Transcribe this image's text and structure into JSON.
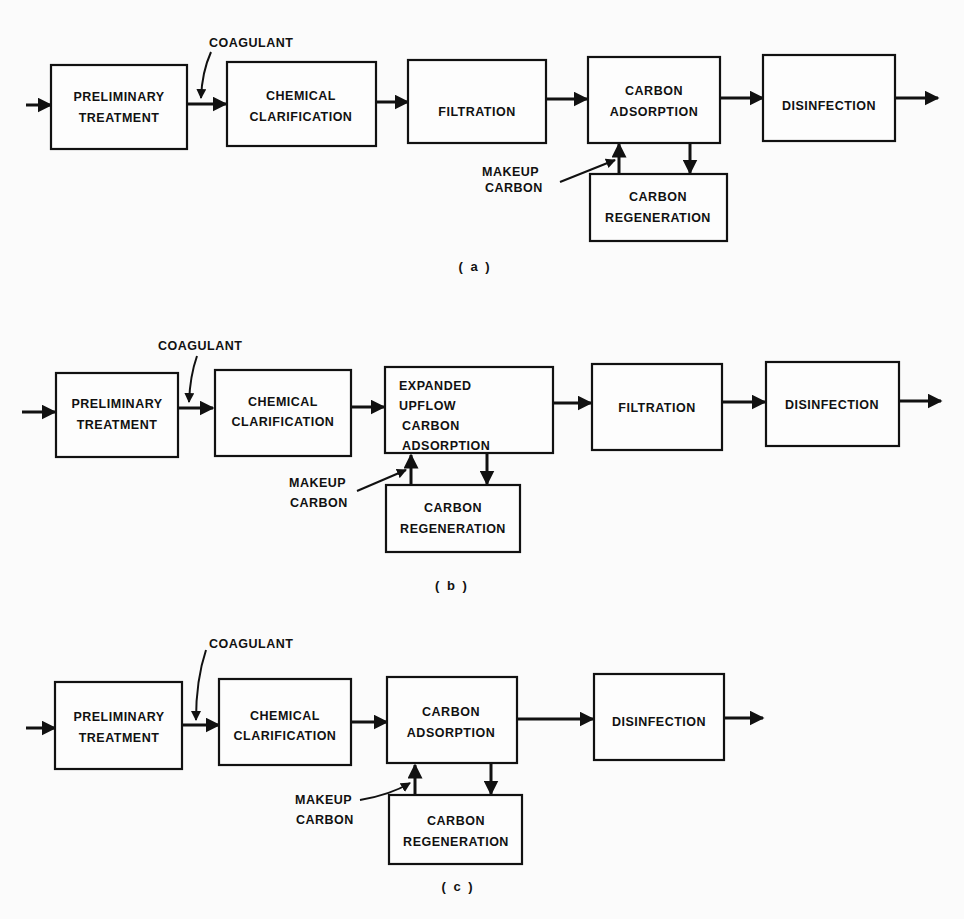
{
  "colors": {
    "ink": "#111111",
    "background": "#fbfbfb"
  },
  "diagrams": [
    {
      "caption": "( a )",
      "coagulant_label": "COAGULANT",
      "makeup_label": [
        "MAKEUP",
        "CARBON"
      ],
      "boxes": [
        {
          "lines": [
            "PRELIMINARY",
            "TREATMENT"
          ]
        },
        {
          "lines": [
            "CHEMICAL",
            "CLARIFICATION"
          ]
        },
        {
          "lines": [
            "FILTRATION"
          ]
        },
        {
          "lines": [
            "CARBON",
            "ADSORPTION"
          ]
        },
        {
          "lines": [
            "DISINFECTION"
          ]
        },
        {
          "lines": [
            "CARBON",
            "REGENERATION"
          ]
        }
      ]
    },
    {
      "caption": "( b )",
      "coagulant_label": "COAGULANT",
      "makeup_label": [
        "MAKEUP",
        "CARBON"
      ],
      "boxes": [
        {
          "lines": [
            "PRELIMINARY",
            "TREATMENT"
          ]
        },
        {
          "lines": [
            "CHEMICAL",
            "CLARIFICATION"
          ]
        },
        {
          "lines": [
            "EXPANDED",
            "UPFLOW",
            "CARBON",
            "ADSORPTION"
          ]
        },
        {
          "lines": [
            "FILTRATION"
          ]
        },
        {
          "lines": [
            "DISINFECTION"
          ]
        },
        {
          "lines": [
            "CARBON",
            "REGENERATION"
          ]
        }
      ]
    },
    {
      "caption": "( c )",
      "coagulant_label": "COAGULANT",
      "makeup_label": [
        "MAKEUP",
        "CARBON"
      ],
      "boxes": [
        {
          "lines": [
            "PRELIMINARY",
            "TREATMENT"
          ]
        },
        {
          "lines": [
            "CHEMICAL",
            "CLARIFICATION"
          ]
        },
        {
          "lines": [
            "CARBON",
            "ADSORPTION"
          ]
        },
        {
          "lines": [
            "DISINFECTION"
          ]
        },
        {
          "lines": [
            "CARBON",
            "REGENERATION"
          ]
        }
      ]
    }
  ]
}
